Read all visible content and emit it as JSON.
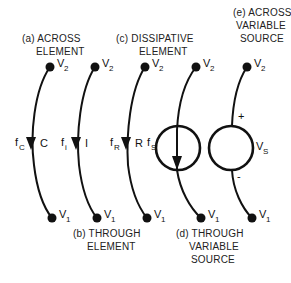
{
  "diagram": {
    "type": "linear graph element representations",
    "colors": {
      "line": "#111111",
      "text": "#222222",
      "background": "#ffffff"
    },
    "elements": [
      {
        "id": "a",
        "caption_lines": [
          "(a) ACROSS",
          "ELEMENT"
        ],
        "top_node": {
          "label": "V",
          "sub": "2"
        },
        "bottom_node": {
          "label": "V",
          "sub": "1"
        },
        "flow_label": {
          "main": "f",
          "sub": "C"
        },
        "element_label": "C"
      },
      {
        "id": "b",
        "caption_lines": [
          "(b) THROUGH",
          "ELEMENT"
        ],
        "top_node": {
          "label": "V",
          "sub": "2"
        },
        "bottom_node": {
          "label": "V",
          "sub": "1"
        },
        "flow_label": {
          "main": "f",
          "sub": "i"
        },
        "element_label": "I"
      },
      {
        "id": "c",
        "caption_lines": [
          "(c) DISSIPATIVE",
          "ELEMENT"
        ],
        "top_node": {
          "label": "V",
          "sub": "2"
        },
        "bottom_node": {
          "label": "V",
          "sub": "1"
        },
        "flow_label": {
          "main": "f",
          "sub": "R"
        },
        "element_label": "R"
      },
      {
        "id": "d",
        "caption_lines": [
          "(d) THROUGH",
          "VARIABLE",
          "SOURCE"
        ],
        "top_node": {
          "label": "V",
          "sub": "2"
        },
        "bottom_node": {
          "label": "V",
          "sub": "1"
        },
        "flow_label": {
          "main": "f",
          "sub": "S"
        }
      },
      {
        "id": "e",
        "caption_lines": [
          "(e) ACROSS",
          "VARIABLE",
          "SOURCE"
        ],
        "top_node": {
          "label": "V",
          "sub": "2"
        },
        "bottom_node": {
          "label": "V",
          "sub": "1"
        },
        "source_label": {
          "main": "V",
          "sub": "S"
        },
        "plus": "+",
        "minus": "-"
      }
    ]
  }
}
